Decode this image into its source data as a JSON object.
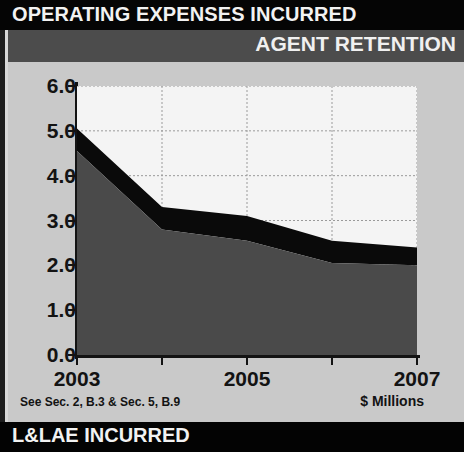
{
  "header": {
    "title": "OPERATING EXPENSES INCURRED",
    "subtitle": "AGENT RETENTION"
  },
  "footer": {
    "bottom_title": "L&LAE INCURRED",
    "source_note": "See Sec. 2, B.3 & Sec. 5, B.9",
    "units_note": "$ Millions"
  },
  "colors": {
    "title_bar_bg": "#050505",
    "subheader_bg": "#4c4c4c",
    "panel_bg": "#c9c9c9",
    "plot_bg": "#f4f4f4",
    "series_lower": "#4a4a4a",
    "series_upper": "#0a0a0a",
    "axis": "#131313",
    "gridline": "#9a9a9a",
    "text_light": "#f2f2f2",
    "text_dark": "#131313"
  },
  "chart_data": {
    "type": "area",
    "stacked": true,
    "title": "AGENT RETENTION",
    "xlabel": "",
    "ylabel": "",
    "units": "$ Millions",
    "x": [
      2003,
      2004,
      2005,
      2006,
      2007
    ],
    "xtick_labels": [
      "2003",
      "",
      "2005",
      "",
      "2007"
    ],
    "xtick_labels_shown": [
      "2003",
      "2005",
      "2007"
    ],
    "ylim": [
      0.0,
      6.0
    ],
    "ytick_values": [
      0.0,
      1.0,
      2.0,
      3.0,
      4.0,
      5.0,
      6.0
    ],
    "ytick_labels": [
      "0.0",
      "1.0",
      "2.0",
      "3.0",
      "4.0",
      "5.0",
      "6.0"
    ],
    "grid": true,
    "grid_axis": "y",
    "legend": "none",
    "series": [
      {
        "name": "lower-band",
        "color": "#4a4a4a",
        "values": [
          4.55,
          2.8,
          2.55,
          2.05,
          2.0
        ]
      },
      {
        "name": "upper-band",
        "color": "#0a0a0a",
        "values": [
          0.5,
          0.5,
          0.55,
          0.5,
          0.4
        ]
      }
    ],
    "series_cumulative_top": [
      5.05,
      3.3,
      3.1,
      2.55,
      2.4
    ]
  }
}
